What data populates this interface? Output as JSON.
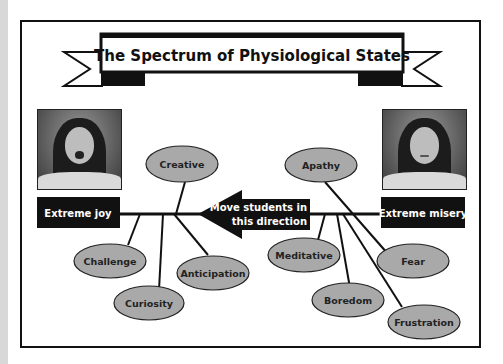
{
  "title": "The Spectrum of Physiological States",
  "left_pole": {
    "label": "Extreme joy",
    "photo": "excited-woman-photo"
  },
  "right_pole": {
    "label": "Extreme misery",
    "photo": "sad-woman-photo"
  },
  "arrow": {
    "line1": "Move students in",
    "line2": "this direction",
    "direction": "left"
  },
  "positive_states": [
    "Creative",
    "Challenge",
    "Curiosity",
    "Anticipation"
  ],
  "negative_states": [
    "Apathy",
    "Meditative",
    "Boredom",
    "Fear",
    "Frustration"
  ],
  "colors": {
    "ellipse_fill": "#a9a9a9",
    "label_bg": "#111111",
    "label_text": "#ffffff",
    "line": "#111111"
  }
}
